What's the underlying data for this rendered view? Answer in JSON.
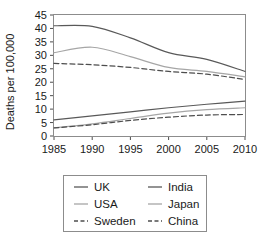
{
  "chart_data": {
    "type": "line",
    "title": "",
    "xlabel": "",
    "ylabel": "Deaths per 100,000",
    "x": [
      1985,
      1990,
      1995,
      2000,
      2005,
      2010
    ],
    "xticks": [
      "1985",
      "1990",
      "1995",
      "2000",
      "2005",
      "2010"
    ],
    "yticks": [
      "0",
      "5",
      "10",
      "15",
      "20",
      "25",
      "30",
      "35",
      "40",
      "45"
    ],
    "xlim": [
      1985,
      2010
    ],
    "ylim": [
      0,
      45
    ],
    "grid": false,
    "legend_position": "bottom",
    "series": [
      {
        "name": "UK",
        "values": [
          41,
          40.8,
          36.5,
          31,
          28.5,
          24
        ],
        "style": "solid",
        "color": "#595959"
      },
      {
        "name": "USA",
        "values": [
          31,
          33,
          29.5,
          25.5,
          24,
          22
        ],
        "style": "solid",
        "color": "#a6a6a6"
      },
      {
        "name": "Sweden",
        "values": [
          27,
          26.5,
          25.5,
          24,
          23,
          21
        ],
        "style": "dashed",
        "color": "#4d4d4d"
      },
      {
        "name": "India",
        "values": [
          6,
          7.5,
          9,
          10.5,
          11.8,
          13
        ],
        "style": "solid",
        "color": "#595959"
      },
      {
        "name": "Japan",
        "values": [
          3,
          4.5,
          6.5,
          8.5,
          9.8,
          10.5
        ],
        "style": "solid",
        "color": "#a6a6a6"
      },
      {
        "name": "China",
        "values": [
          3,
          4.2,
          5.8,
          7,
          7.8,
          8
        ],
        "style": "dashed",
        "color": "#4d4d4d"
      }
    ]
  },
  "legend": {
    "entries": [
      {
        "label": "UK",
        "style": "solid",
        "color": "#595959"
      },
      {
        "label": "India",
        "style": "solid",
        "color": "#595959"
      },
      {
        "label": "USA",
        "style": "solid",
        "color": "#a6a6a6"
      },
      {
        "label": "Japan",
        "style": "solid",
        "color": "#a6a6a6"
      },
      {
        "label": "Sweden",
        "style": "dashed",
        "color": "#4d4d4d"
      },
      {
        "label": "China",
        "style": "dashed",
        "color": "#4d4d4d"
      }
    ]
  },
  "colors": {
    "frame": "#8c8c8c",
    "text": "#1a1a1a",
    "background": "#ffffff"
  }
}
